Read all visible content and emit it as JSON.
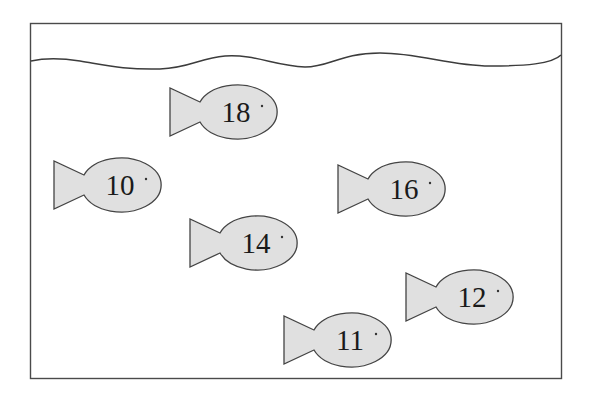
{
  "scene": {
    "description": "Fish tank with six numbered fish",
    "colors": {
      "background": "#ffffff",
      "frame_stroke": "#4a4a4a",
      "water_stroke": "#3c3c3c",
      "fish_fill": "#e0e0e0",
      "fish_stroke": "#444444",
      "label_color": "#1a1a1a"
    }
  },
  "fish": [
    {
      "label": "18",
      "cx": 234,
      "cy": 112
    },
    {
      "label": "10",
      "cx": 118,
      "cy": 185
    },
    {
      "label": "16",
      "cx": 402,
      "cy": 189
    },
    {
      "label": "14",
      "cx": 254,
      "cy": 243
    },
    {
      "label": "12",
      "cx": 470,
      "cy": 297
    },
    {
      "label": "11",
      "cx": 348,
      "cy": 340
    }
  ]
}
